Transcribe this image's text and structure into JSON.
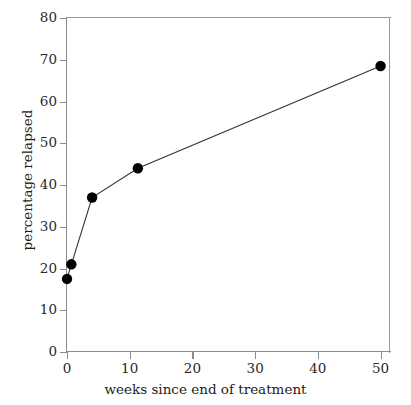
{
  "chart_data": {
    "type": "line",
    "title": "",
    "xlabel": "weeks since end of treatment",
    "ylabel": "percentage relapsed",
    "xlim": [
      0,
      51.5
    ],
    "ylim": [
      0,
      80
    ],
    "grid": false,
    "legend": false,
    "marker": "filled-circle",
    "marker_color": "#000000",
    "line_color": "#333333",
    "xticks": [
      0,
      10,
      20,
      30,
      40,
      50
    ],
    "xticklabels": [
      "0",
      "10",
      "20",
      "30",
      "40",
      "50"
    ],
    "yticks": [
      0,
      10,
      20,
      30,
      40,
      50,
      60,
      70,
      80
    ],
    "yticklabels": [
      "0",
      "10",
      "20",
      "30",
      "40",
      "50",
      "60",
      "70",
      "80"
    ],
    "series": [
      {
        "name": "percentage relapsed",
        "x": [
          0,
          0.7,
          4,
          11.3,
          50
        ],
        "y": [
          17.5,
          21,
          37,
          44,
          68.5
        ]
      }
    ]
  },
  "figure": {
    "background": "#ffffff",
    "axis_color": "#8c8c8c"
  }
}
